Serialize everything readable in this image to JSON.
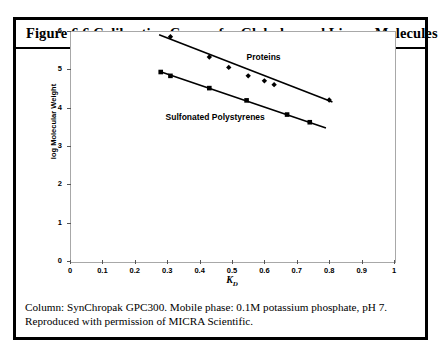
{
  "figure": {
    "title": "Figure 6.6  Calibration Curves for Globular and Linear Molecules",
    "caption": "Column: SynChropak GPC300.  Mobile phase: 0.1M potassium phosphate, pH 7.  Reproduced with permission of MICRA Scientific."
  },
  "chart_data": {
    "type": "scatter",
    "title": "Calibration Curves for Globular and Linear Molecules",
    "xlabel": "K_D",
    "ylabel": "log Molecular Weight",
    "xlim": [
      0,
      1
    ],
    "ylim": [
      0,
      6
    ],
    "xticks": [
      "0",
      "0.1",
      "0.2",
      "0.3",
      "0.4",
      "0.5",
      "0.6",
      "0.7",
      "0.8",
      "0.9",
      "1"
    ],
    "yticks": [
      "0",
      "1",
      "2",
      "3",
      "4",
      "5",
      "6"
    ],
    "grid": false,
    "legend_position": "inline-annotations",
    "series": [
      {
        "name": "Proteins",
        "marker": "diamond",
        "color": "#000000",
        "points": [
          {
            "x": 0.31,
            "y": 5.85
          },
          {
            "x": 0.43,
            "y": 5.32
          },
          {
            "x": 0.49,
            "y": 5.05
          },
          {
            "x": 0.55,
            "y": 4.83
          },
          {
            "x": 0.6,
            "y": 4.7
          },
          {
            "x": 0.63,
            "y": 4.6
          },
          {
            "x": 0.8,
            "y": 4.2
          }
        ],
        "fit_line": {
          "x1": 0.275,
          "y1": 5.9,
          "x2": 0.81,
          "y2": 4.15
        },
        "label_x": 0.545,
        "label_y": 5.32
      },
      {
        "name": "Sulfonated Polystyrenes",
        "marker": "square",
        "color": "#000000",
        "points": [
          {
            "x": 0.28,
            "y": 4.93
          },
          {
            "x": 0.31,
            "y": 4.83
          },
          {
            "x": 0.43,
            "y": 4.51
          },
          {
            "x": 0.545,
            "y": 4.19
          },
          {
            "x": 0.67,
            "y": 3.82
          },
          {
            "x": 0.74,
            "y": 3.62
          }
        ],
        "fit_line": {
          "x1": 0.275,
          "y1": 4.95,
          "x2": 0.79,
          "y2": 3.47
        },
        "label_x": 0.295,
        "label_y": 3.75
      }
    ]
  }
}
